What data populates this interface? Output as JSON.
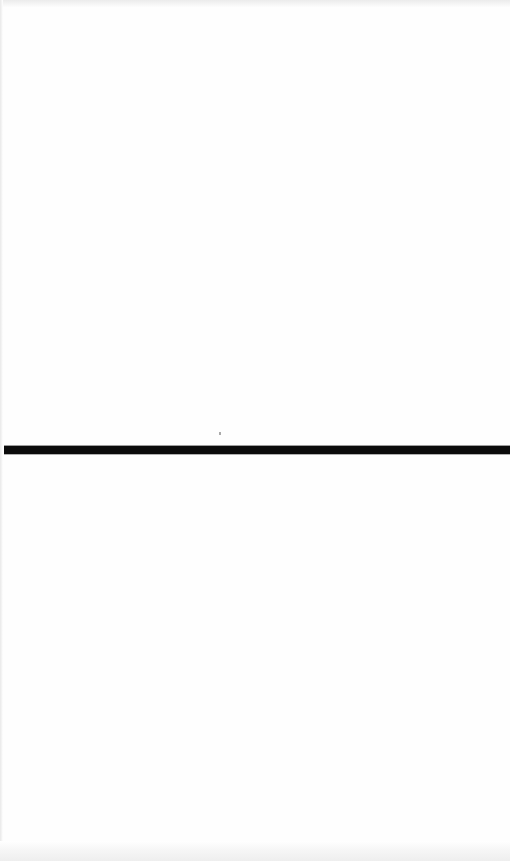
{
  "page": {
    "kind": "scanned-document-page",
    "width": 510,
    "height": 861,
    "background_color": "#ffffff",
    "paper_tint_color": "#fefefe",
    "text_content": "",
    "has_text": false
  },
  "marks": {
    "horizontal_rule": {
      "name": "horizontal-rule",
      "color": "#0b0b0b",
      "left": 4,
      "top": 446,
      "width": 506,
      "height": 8,
      "description": "solid black horizontal divider rule spanning nearly the full page width"
    },
    "scan_speck": {
      "name": "scan-speck",
      "color": "#aaaaaa",
      "left": 219,
      "top": 432,
      "width": 2,
      "height": 3
    }
  },
  "scan_artifacts": {
    "top_edge": {
      "name": "scan-edge-top",
      "color": "#ebebeb",
      "height": 8
    },
    "bottom_edge": {
      "name": "scan-edge-bottom",
      "color": "#eeeeee",
      "height": 20
    },
    "left_edge": {
      "name": "scan-edge-left",
      "color": "#e9e9e9",
      "width": 3
    }
  },
  "regions": {
    "upper_blank": {
      "name": "upper-blank-region",
      "top": 8,
      "height": 438
    },
    "lower_blank": {
      "name": "lower-blank-region",
      "top": 454,
      "height": 387
    }
  }
}
